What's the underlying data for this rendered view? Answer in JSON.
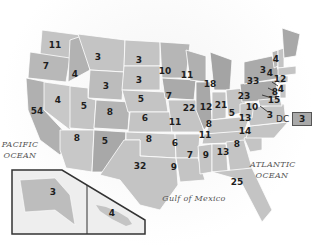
{
  "map": {
    "title": "Electoral votes by state",
    "colors": {
      "state_fill": "#c4c4c4",
      "state_dark": "#a8a8a8",
      "border": "#ffffff",
      "text": "#1e1e1e",
      "water_label": "#555555"
    },
    "water_labels": {
      "pacific": "PACIFIC OCEAN",
      "atlantic": "ATLANTIC OCEAN",
      "gulf": "Gulf of Mexico"
    },
    "dc": {
      "label": "DC",
      "value": "3"
    },
    "states": [
      {
        "state": "WA",
        "value": "11"
      },
      {
        "state": "OR",
        "value": "7"
      },
      {
        "state": "ID",
        "value": "4"
      },
      {
        "state": "MT",
        "value": "3"
      },
      {
        "state": "WY",
        "value": "3"
      },
      {
        "state": "ND",
        "value": "3"
      },
      {
        "state": "SD",
        "value": "3"
      },
      {
        "state": "NE",
        "value": "5"
      },
      {
        "state": "CA",
        "value": "54"
      },
      {
        "state": "NV",
        "value": "4"
      },
      {
        "state": "UT",
        "value": "5"
      },
      {
        "state": "CO",
        "value": "8"
      },
      {
        "state": "AZ",
        "value": "8"
      },
      {
        "state": "NM",
        "value": "5"
      },
      {
        "state": "KS",
        "value": "6"
      },
      {
        "state": "OK",
        "value": "8"
      },
      {
        "state": "TX",
        "value": "32"
      },
      {
        "state": "MN",
        "value": "10"
      },
      {
        "state": "IA",
        "value": "7"
      },
      {
        "state": "MO",
        "value": "11"
      },
      {
        "state": "AR",
        "value": "6"
      },
      {
        "state": "LA",
        "value": "9"
      },
      {
        "state": "WI",
        "value": "11"
      },
      {
        "state": "IL",
        "value": "22"
      },
      {
        "state": "MI",
        "value": "18"
      },
      {
        "state": "IN",
        "value": "12"
      },
      {
        "state": "OH",
        "value": "21"
      },
      {
        "state": "KY",
        "value": "8"
      },
      {
        "state": "TN",
        "value": "11"
      },
      {
        "state": "MS",
        "value": "7"
      },
      {
        "state": "AL",
        "value": "9"
      },
      {
        "state": "GA",
        "value": "13"
      },
      {
        "state": "FL",
        "value": "25"
      },
      {
        "state": "SC",
        "value": "8"
      },
      {
        "state": "NC",
        "value": "14"
      },
      {
        "state": "VA",
        "value": "13"
      },
      {
        "state": "WV",
        "value": "5"
      },
      {
        "state": "PA",
        "value": "23"
      },
      {
        "state": "NY",
        "value": "33"
      },
      {
        "state": "VT",
        "value": "3"
      },
      {
        "state": "NH",
        "value": "4"
      },
      {
        "state": "ME",
        "value": "4"
      },
      {
        "state": "MA",
        "value": "12"
      },
      {
        "state": "RI",
        "value": "4"
      },
      {
        "state": "CT",
        "value": "8"
      },
      {
        "state": "NJ",
        "value": "15"
      },
      {
        "state": "DE",
        "value": "3"
      },
      {
        "state": "MD",
        "value": "10"
      },
      {
        "state": "AK",
        "value": "3"
      },
      {
        "state": "HI",
        "value": "4"
      }
    ]
  }
}
